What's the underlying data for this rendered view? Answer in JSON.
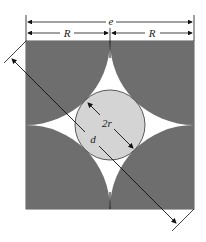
{
  "figure": {
    "labels": {
      "total_width": "e",
      "half_left": "R",
      "half_right": "R",
      "inner_diameter": "2r",
      "diagonal": "d"
    },
    "colors": {
      "fill": "#6e6e6e",
      "circle": "#d4d4d4",
      "background": "#ffffff",
      "line": "#111111"
    }
  }
}
